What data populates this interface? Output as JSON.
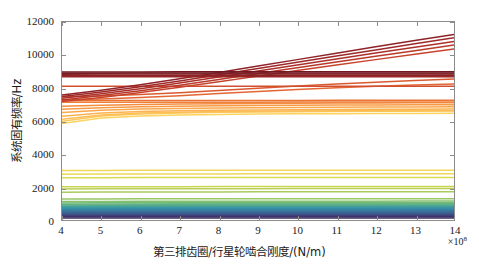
{
  "figure": {
    "title": "",
    "width": 479,
    "height": 277
  },
  "axes": {
    "y_title": "系统固有频率/Hz",
    "x_title": "第三排齿圈/行星轮啮合刚度/(N/m)",
    "x_exponent_prefix": "×10",
    "x_exponent_power": "8",
    "y_ticks": [
      "0",
      "2000",
      "4000",
      "6000",
      "8000",
      "10000",
      "12000"
    ],
    "x_ticks": [
      "4",
      "5",
      "6",
      "7",
      "8",
      "9",
      "10",
      "11",
      "12",
      "13",
      "14"
    ],
    "frame_color": "#8c8c8c"
  },
  "chart_data": {
    "type": "line",
    "title": "",
    "xlabel": "第三排齿圈/行星轮啮合刚度/(N/m)",
    "ylabel": "系统固有频率/Hz",
    "xlim": [
      4,
      14
    ],
    "ylim": [
      0,
      12000
    ],
    "x_scale_factor": "1e8",
    "grid": false,
    "legend": "none",
    "x": [
      4,
      5,
      6,
      7,
      8,
      9,
      10,
      11,
      12,
      13,
      14
    ],
    "series": [
      {
        "name": "mode-1",
        "color": "#3b2a5e",
        "values": [
          120,
          120,
          120,
          120,
          120,
          120,
          120,
          120,
          120,
          120,
          120
        ]
      },
      {
        "name": "mode-2",
        "color": "#3d2f66",
        "values": [
          190,
          190,
          190,
          190,
          190,
          190,
          190,
          190,
          190,
          190,
          190
        ]
      },
      {
        "name": "mode-3",
        "color": "#403a70",
        "values": [
          255,
          255,
          255,
          255,
          255,
          255,
          255,
          255,
          255,
          255,
          255
        ]
      },
      {
        "name": "mode-4",
        "color": "#42447a",
        "values": [
          300,
          300,
          300,
          300,
          300,
          300,
          300,
          300,
          300,
          300,
          300
        ]
      },
      {
        "name": "mode-5",
        "color": "#3f4f84",
        "values": [
          345,
          345,
          345,
          345,
          345,
          345,
          345,
          345,
          345,
          345,
          345
        ]
      },
      {
        "name": "mode-6",
        "color": "#3d5a8c",
        "values": [
          395,
          396,
          397,
          398,
          399,
          400,
          400,
          401,
          401,
          402,
          402
        ]
      },
      {
        "name": "mode-7",
        "color": "#3b6493",
        "values": [
          450,
          452,
          453,
          454,
          455,
          456,
          457,
          457,
          458,
          458,
          459
        ]
      },
      {
        "name": "mode-8",
        "color": "#3a6e99",
        "values": [
          510,
          512,
          514,
          515,
          516,
          517,
          518,
          518,
          519,
          519,
          520
        ]
      },
      {
        "name": "mode-9",
        "color": "#38789e",
        "values": [
          570,
          573,
          575,
          577,
          578,
          579,
          580,
          581,
          581,
          582,
          582
        ]
      },
      {
        "name": "mode-10",
        "color": "#3782a2",
        "values": [
          630,
          634,
          637,
          639,
          640,
          641,
          642,
          643,
          644,
          644,
          645
        ]
      },
      {
        "name": "mode-11",
        "color": "#368ca4",
        "values": [
          690,
          695,
          698,
          700,
          702,
          703,
          704,
          705,
          705,
          706,
          706
        ]
      },
      {
        "name": "mode-12",
        "color": "#3a95a3",
        "values": [
          745,
          751,
          755,
          757,
          759,
          760,
          761,
          762,
          763,
          763,
          764
        ]
      },
      {
        "name": "mode-13",
        "color": "#409d9e",
        "values": [
          800,
          807,
          811,
          814,
          816,
          817,
          818,
          819,
          820,
          820,
          821
        ]
      },
      {
        "name": "mode-14",
        "color": "#4aa596",
        "values": [
          855,
          862,
          867,
          870,
          872,
          874,
          875,
          876,
          877,
          877,
          878
        ]
      },
      {
        "name": "mode-15",
        "color": "#56ac8c",
        "values": [
          905,
          913,
          918,
          922,
          924,
          926,
          927,
          928,
          929,
          929,
          930
        ]
      },
      {
        "name": "mode-16",
        "color": "#64b382",
        "values": [
          960,
          968,
          974,
          978,
          980,
          982,
          983,
          984,
          985,
          985,
          986
        ]
      },
      {
        "name": "mode-17",
        "color": "#74ba78",
        "values": [
          1035,
          1044,
          1050,
          1054,
          1057,
          1059,
          1060,
          1061,
          1062,
          1063,
          1063
        ]
      },
      {
        "name": "mode-18",
        "color": "#85c06f",
        "values": [
          1115,
          1124,
          1130,
          1135,
          1138,
          1140,
          1141,
          1142,
          1143,
          1144,
          1145
        ]
      },
      {
        "name": "mode-19",
        "color": "#97c666",
        "values": [
          1270,
          1278,
          1283,
          1287,
          1289,
          1291,
          1292,
          1293,
          1294,
          1295,
          1295
        ]
      },
      {
        "name": "mode-20",
        "color": "#a9cb5e",
        "values": [
          1680,
          1690,
          1697,
          1701,
          1704,
          1706,
          1708,
          1709,
          1710,
          1711,
          1711
        ]
      },
      {
        "name": "mode-21",
        "color": "#bbd058",
        "values": [
          1880,
          1888,
          1893,
          1897,
          1899,
          1901,
          1902,
          1903,
          1904,
          1904,
          1905
        ]
      },
      {
        "name": "mode-22",
        "color": "#cbd554",
        "values": [
          2010,
          2015,
          2019,
          2021,
          2023,
          2024,
          2025,
          2026,
          2026,
          2027,
          2027
        ]
      },
      {
        "name": "mode-23",
        "color": "#dcd953",
        "values": [
          2560,
          2566,
          2570,
          2573,
          2575,
          2576,
          2577,
          2578,
          2579,
          2579,
          2580
        ]
      },
      {
        "name": "mode-24",
        "color": "#ead955",
        "values": [
          2780,
          2786,
          2790,
          2793,
          2795,
          2796,
          2797,
          2798,
          2799,
          2799,
          2800
        ]
      },
      {
        "name": "mode-25",
        "color": "#f2d85a",
        "values": [
          3000,
          3005,
          3008,
          3011,
          3012,
          3013,
          3014,
          3015,
          3016,
          3016,
          3017
        ]
      },
      {
        "name": "mode-26",
        "color": "#fbd35f",
        "values": [
          5850,
          6180,
          6310,
          6370,
          6400,
          6420,
          6435,
          6445,
          6455,
          6462,
          6468
        ]
      },
      {
        "name": "mode-27",
        "color": "#fcc85c",
        "values": [
          5980,
          6300,
          6430,
          6490,
          6525,
          6548,
          6564,
          6576,
          6586,
          6594,
          6600
        ]
      },
      {
        "name": "mode-28",
        "color": "#fcbe57",
        "values": [
          6110,
          6370,
          6480,
          6535,
          6568,
          6590,
          6606,
          6618,
          6627,
          6635,
          6641
        ]
      },
      {
        "name": "mode-29",
        "color": "#fbb351",
        "values": [
          6290,
          6480,
          6570,
          6620,
          6650,
          6672,
          6688,
          6700,
          6710,
          6718,
          6724
        ]
      },
      {
        "name": "mode-30",
        "color": "#faa74c",
        "values": [
          6520,
          6650,
          6720,
          6762,
          6790,
          6810,
          6825,
          6837,
          6846,
          6854,
          6860
        ]
      },
      {
        "name": "mode-31",
        "color": "#f79a45",
        "values": [
          6710,
          6810,
          6865,
          6900,
          6925,
          6942,
          6956,
          6967,
          6976,
          6983,
          6989
        ]
      },
      {
        "name": "mode-32",
        "color": "#f48d3f",
        "values": [
          6890,
          6960,
          7000,
          7028,
          7048,
          7063,
          7075,
          7085,
          7093,
          7100,
          7105
        ]
      },
      {
        "name": "mode-33",
        "color": "#ef803a",
        "values": [
          7130,
          7135,
          7138,
          7140,
          7142,
          7143,
          7144,
          7145,
          7146,
          7146,
          7147
        ]
      },
      {
        "name": "mode-34",
        "color": "#e97436",
        "values": [
          7235,
          7240,
          7243,
          7246,
          7248,
          7249,
          7250,
          7251,
          7252,
          7252,
          7253
        ]
      },
      {
        "name": "mode-35",
        "color": "#e26733",
        "values": [
          7295,
          7340,
          7420,
          7530,
          7660,
          7790,
          7910,
          8010,
          8100,
          8180,
          8250
        ]
      },
      {
        "name": "mode-36",
        "color": "#da5a30",
        "values": [
          7470,
          7520,
          7600,
          7710,
          7850,
          7990,
          8120,
          8240,
          8350,
          8450,
          8540
        ]
      },
      {
        "name": "mode-37",
        "color": "#d14e2e",
        "values": [
          8100,
          8102,
          8104,
          8105,
          8106,
          8107,
          8108,
          8108,
          8109,
          8109,
          8110
        ]
      },
      {
        "name": "mode-38",
        "color": "#c6432c",
        "values": [
          7180,
          7430,
          7720,
          8040,
          8380,
          8720,
          9060,
          9390,
          9720,
          10050,
          10370
        ]
      },
      {
        "name": "mode-39",
        "color": "#b9392b",
        "values": [
          7280,
          7540,
          7840,
          8170,
          8520,
          8880,
          9230,
          9580,
          9920,
          10260,
          10600
        ]
      },
      {
        "name": "mode-40",
        "color": "#ac302a",
        "values": [
          7380,
          7650,
          7960,
          8300,
          8660,
          9030,
          9400,
          9760,
          10120,
          10470,
          10820
        ]
      },
      {
        "name": "mode-41",
        "color": "#9e2929",
        "values": [
          7480,
          7760,
          8080,
          8430,
          8800,
          9180,
          9560,
          9940,
          10310,
          10680,
          11040
        ]
      },
      {
        "name": "mode-42",
        "color": "#8f2328",
        "values": [
          7580,
          7870,
          8200,
          8560,
          8940,
          9330,
          9720,
          10110,
          10500,
          10880,
          11250
        ]
      },
      {
        "name": "mode-43",
        "color": "#9b2727",
        "values": [
          8680,
          8681,
          8682,
          8683,
          8684,
          8685,
          8686,
          8686,
          8687,
          8687,
          8688
        ]
      },
      {
        "name": "mode-44",
        "color": "#8d2226",
        "values": [
          8760,
          8761,
          8762,
          8763,
          8764,
          8765,
          8766,
          8766,
          8767,
          8767,
          8768
        ]
      },
      {
        "name": "mode-45",
        "color": "#831f25",
        "values": [
          8840,
          8841,
          8842,
          8843,
          8844,
          8845,
          8846,
          8846,
          8847,
          8847,
          8848
        ]
      },
      {
        "name": "mode-46",
        "color": "#7a1c24",
        "values": [
          8900,
          8901,
          8902,
          8903,
          8904,
          8905,
          8906,
          8906,
          8907,
          8907,
          8908
        ]
      },
      {
        "name": "mode-47",
        "color": "#701922",
        "values": [
          8975,
          8976,
          8977,
          8978,
          8979,
          8980,
          8981,
          8981,
          8982,
          8982,
          8983
        ]
      }
    ]
  }
}
